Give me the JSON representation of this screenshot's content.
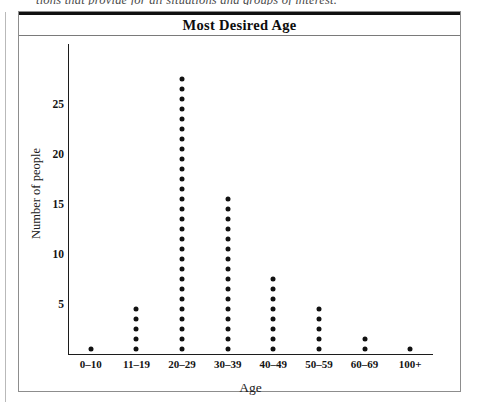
{
  "page": {
    "top_text_fragment": "tions that provide for all situations and groups of interest."
  },
  "figure": {
    "title": "Most Desired Age"
  },
  "chart_data": {
    "type": "bar",
    "plot_style": "dot-plot",
    "title": "Most Desired Age",
    "xlabel": "Age",
    "ylabel": "Number of people",
    "categories": [
      "0–10",
      "11–19",
      "20–29",
      "30–39",
      "40–49",
      "50–59",
      "60–69",
      "100+"
    ],
    "values": [
      1,
      5,
      28,
      16,
      8,
      5,
      2,
      1
    ],
    "yticks": [
      5,
      10,
      15,
      20,
      25
    ],
    "ylim": [
      0,
      29
    ],
    "grid": false,
    "legend": false,
    "dot_color": "#111111",
    "axis_color": "#1c1c1c"
  }
}
